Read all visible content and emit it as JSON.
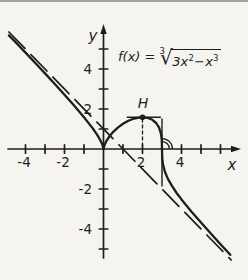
{
  "window": {
    "background": "#f5f4f1",
    "ink": "#1d1d1b",
    "top_edge_color": "#a3a39f"
  },
  "formula": {
    "lhs": "f(x) =",
    "root_index": "3",
    "radicand_1": "3x",
    "sup_1": "2",
    "radicand_2": "−x",
    "sup_2": "3"
  },
  "labels": {
    "y_axis": "y",
    "x_axis": "x",
    "max_point": "H"
  },
  "chart_data": {
    "type": "line",
    "xlabel": "x",
    "ylabel": "y",
    "xlim": [
      -4.9,
      7.0
    ],
    "ylim": [
      -5.6,
      6.3
    ],
    "grid": false,
    "legend": "none",
    "layout": {
      "origin_px": [
        103.5,
        149
      ],
      "px_per_unit_x": 19.5,
      "px_per_unit_y": 20,
      "x_axis_px_from": 8,
      "x_axis_px_to": 241,
      "y_axis_px_from": 258,
      "y_axis_px_to": 24,
      "tick_half_len": 4.2
    },
    "x_ticks": [
      {
        "value": -4,
        "label": "-4"
      },
      {
        "value": -3,
        "label": ""
      },
      {
        "value": -2,
        "label": "-2"
      },
      {
        "value": -1,
        "label": ""
      },
      {
        "value": 1,
        "label": ""
      },
      {
        "value": 2,
        "label": "2"
      },
      {
        "value": 3,
        "label": ""
      },
      {
        "value": 4,
        "label": "4"
      },
      {
        "value": 5,
        "label": ""
      },
      {
        "value": 6,
        "label": ""
      }
    ],
    "y_ticks": [
      {
        "value": -5,
        "label": ""
      },
      {
        "value": -4,
        "label": "-4"
      },
      {
        "value": -3,
        "label": ""
      },
      {
        "value": -2,
        "label": "-2"
      },
      {
        "value": -1,
        "label": ""
      },
      {
        "value": 1,
        "label": ""
      },
      {
        "value": 2,
        "label": "2"
      },
      {
        "value": 3,
        "label": ""
      },
      {
        "value": 4,
        "label": "4"
      },
      {
        "value": 5,
        "label": ""
      }
    ],
    "series": [
      {
        "name": "f(x) = (3x²−x³)^(1/3)",
        "style": "solid",
        "stroke_width": 2.3,
        "points": [
          [
            -4.85,
            5.68
          ],
          [
            -4.5,
            5.33
          ],
          [
            -4,
            4.82
          ],
          [
            -3.5,
            4.3
          ],
          [
            -3,
            3.78
          ],
          [
            -2.5,
            3.25
          ],
          [
            -2,
            2.71
          ],
          [
            -1.5,
            2.16
          ],
          [
            -1,
            1.59
          ],
          [
            -0.7,
            1.22
          ],
          [
            -0.5,
            0.96
          ],
          [
            -0.3,
            0.67
          ],
          [
            -0.15,
            0.41
          ],
          [
            -0.05,
            0.2
          ],
          [
            0,
            0
          ],
          [
            0.05,
            0.2
          ],
          [
            0.15,
            0.4
          ],
          [
            0.3,
            0.62
          ],
          [
            0.5,
            0.86
          ],
          [
            0.75,
            1.08
          ],
          [
            1,
            1.26
          ],
          [
            1.25,
            1.4
          ],
          [
            1.5,
            1.5
          ],
          [
            1.75,
            1.56
          ],
          [
            2,
            1.587
          ],
          [
            2.25,
            1.56
          ],
          [
            2.5,
            1.46
          ],
          [
            2.7,
            1.3
          ],
          [
            2.85,
            1.07
          ],
          [
            2.95,
            0.76
          ],
          [
            2.99,
            0.45
          ],
          [
            3,
            0
          ],
          [
            3.01,
            -0.45
          ],
          [
            3.05,
            -0.78
          ],
          [
            3.15,
            -1.14
          ],
          [
            3.3,
            -1.48
          ],
          [
            3.5,
            -1.83
          ],
          [
            3.75,
            -2.2
          ],
          [
            4,
            -2.52
          ],
          [
            4.5,
            -3.12
          ],
          [
            5,
            -3.68
          ],
          [
            5.5,
            -4.23
          ],
          [
            6,
            -4.76
          ],
          [
            6.5,
            -5.29
          ]
        ]
      },
      {
        "name": "asymptote y = 1 − x",
        "style": "long-dash",
        "stroke_width": 1.7,
        "dash": "23 8.5",
        "points": [
          [
            -4.85,
            5.85
          ],
          [
            6.55,
            -5.55
          ]
        ]
      }
    ],
    "annotations": {
      "max_point": {
        "label": "H",
        "x": 2,
        "y": 1.587,
        "dot_radius_px": 2.8
      },
      "horizontal_tangent": {
        "y": 1.587,
        "x_from": 1.22,
        "x_to": 2.92
      },
      "drop_line": {
        "x": 2,
        "y_from": 1.5,
        "y_to": 0.05,
        "style": "dashed",
        "dash": "3 3"
      },
      "vertical_tangent": {
        "x": 3,
        "y_from": 1.5,
        "y_to": -1.85
      },
      "right_angle_arc": {
        "center_x": 3,
        "center_y": 0,
        "radii_px": [
          7.5,
          10.5
        ]
      }
    }
  }
}
